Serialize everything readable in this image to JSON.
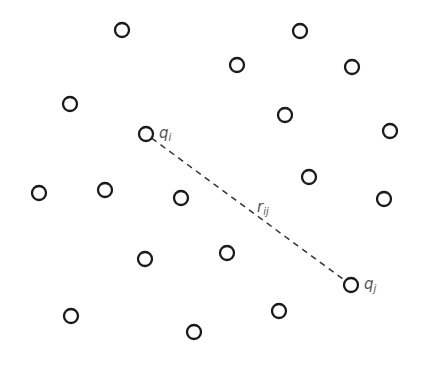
{
  "diagram": {
    "particles": [
      {
        "x": 122,
        "y": 30
      },
      {
        "x": 300,
        "y": 31
      },
      {
        "x": 237,
        "y": 65
      },
      {
        "x": 352,
        "y": 67
      },
      {
        "x": 70,
        "y": 104
      },
      {
        "x": 285,
        "y": 115
      },
      {
        "x": 390,
        "y": 131
      },
      {
        "x": 146,
        "y": 134,
        "label": "qi"
      },
      {
        "x": 309,
        "y": 177
      },
      {
        "x": 39,
        "y": 193
      },
      {
        "x": 105,
        "y": 190
      },
      {
        "x": 181,
        "y": 198
      },
      {
        "x": 384,
        "y": 199
      },
      {
        "x": 227,
        "y": 253
      },
      {
        "x": 145,
        "y": 259
      },
      {
        "x": 351,
        "y": 285,
        "label": "qj"
      },
      {
        "x": 279,
        "y": 311
      },
      {
        "x": 71,
        "y": 316
      },
      {
        "x": 194,
        "y": 332
      }
    ],
    "particle_radius": 7,
    "labels": {
      "qi": {
        "base": "q",
        "sub": "i"
      },
      "qj": {
        "base": "q",
        "sub": "j"
      },
      "rij": {
        "base": "r",
        "sub": "ij"
      }
    },
    "connection": {
      "from": "qi",
      "to": "qj",
      "style": "dashed",
      "label": "rij"
    },
    "colors": {
      "stroke": "#1a1a1a",
      "label": "#555555",
      "background": "#ffffff"
    }
  }
}
